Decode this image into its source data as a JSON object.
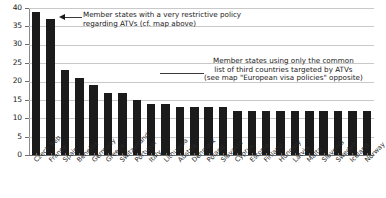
{
  "chart_data": {
    "type": "bar",
    "title": "",
    "xlabel": "",
    "ylabel": "",
    "ylim": [
      0,
      40
    ],
    "ytick_values": [
      0,
      5,
      10,
      15,
      20,
      25,
      30,
      35,
      40
    ],
    "ytick_labels": [
      "0",
      "5",
      "10",
      "15",
      "20",
      "25",
      "30",
      "35",
      "40"
    ],
    "grid": true,
    "legend": "none",
    "bar_color": "#1b1b1b",
    "gridline_color": "#c9c9c9",
    "categories": [
      "Czech Rep.",
      "France",
      "Spain",
      "Benelux",
      "Germany",
      "Greece",
      "Switzerland",
      "Portugal",
      "Italy",
      "Lithuania",
      "Austria",
      "Denmark",
      "Poland",
      "Slovakia",
      "Cyprus",
      "Estonia",
      "Finland",
      "Hungary",
      "Latvia",
      "Malta",
      "Slovenia",
      "Sweden",
      "Iceland",
      "Norway"
    ],
    "values": [
      39,
      37,
      23,
      21,
      19,
      17,
      17,
      15,
      14,
      14,
      13,
      13,
      13,
      13,
      12,
      12,
      12,
      12,
      12,
      12,
      12,
      12,
      12,
      12
    ],
    "annotations": [
      {
        "id": "restrictive-policy-note",
        "lines": [
          "Member states with a very restrictive policy",
          "regarding ATVs (cf. map above)"
        ],
        "has_arrow": true,
        "arrow_direction": "left",
        "points_to": "France"
      },
      {
        "id": "common-list-note",
        "lines": [
          "Member states using only the common",
          "list of third countries targeted by ATVs",
          "(see map \"European visa policies\" opposite)"
        ],
        "has_arrow": false,
        "arrow_direction": "",
        "points_to": "Cyprus"
      }
    ]
  }
}
